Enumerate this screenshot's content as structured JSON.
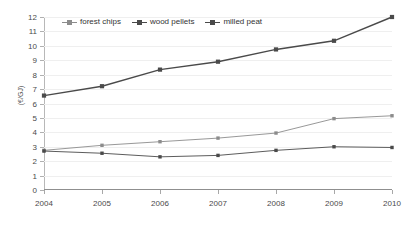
{
  "chart_data": {
    "type": "line",
    "title": "",
    "xlabel": "",
    "ylabel": "(€/GJ)",
    "categories": [
      "2004",
      "2005",
      "2006",
      "2007",
      "2008",
      "2009",
      "2010"
    ],
    "x": [
      2004,
      2005,
      2006,
      2007,
      2008,
      2009,
      2010
    ],
    "ylim": [
      0,
      12
    ],
    "ytick_step": 1,
    "yticks": [
      "12",
      "11",
      "10",
      "9",
      "8",
      "7",
      "6",
      "5",
      "4",
      "3",
      "2",
      "1",
      "0"
    ],
    "grid": true,
    "legend_position": "top-left-inside",
    "series": [
      {
        "name": "forest chips",
        "color": "#8c8c8c",
        "marker": "square",
        "values": [
          2.75,
          3.1,
          3.35,
          3.6,
          3.95,
          4.95,
          5.15
        ]
      },
      {
        "name": "wood pellets",
        "color": "#4a4a4a",
        "marker": "square",
        "values": [
          6.55,
          7.2,
          8.35,
          8.9,
          9.75,
          10.35,
          12.0
        ]
      },
      {
        "name": "milled peat",
        "color": "#4a4a4a",
        "marker": "square",
        "values": [
          2.7,
          2.55,
          2.3,
          2.4,
          2.75,
          3.0,
          2.95
        ]
      }
    ]
  },
  "colors": {
    "background": "#ffffff",
    "grid": "#efefef",
    "axis": "#9a9a9a",
    "text": "#4a4a4a"
  }
}
